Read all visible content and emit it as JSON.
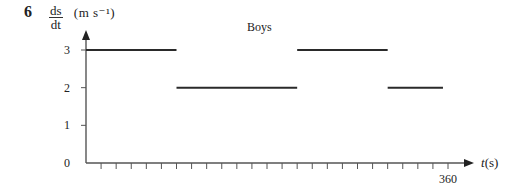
{
  "question_number": "6",
  "y_axis": {
    "label_numerator": "ds",
    "label_denominator": "dt",
    "unit": "(m s⁻¹)"
  },
  "x_axis": {
    "label_var": "t",
    "label_unit": "(s)",
    "end_label": "360"
  },
  "title": "Boys",
  "chart_data": {
    "type": "line",
    "title": "Boys",
    "xlabel": "t (s)",
    "ylabel": "ds/dt (m s⁻¹)",
    "xlim": [
      0,
      360
    ],
    "ylim": [
      0,
      3
    ],
    "x_ticks": {
      "count": 24,
      "step": 15,
      "labeled": [
        {
          "value": 360,
          "label": "360"
        }
      ]
    },
    "y_ticks": [
      0,
      1,
      2,
      3
    ],
    "grid": false,
    "series": [
      {
        "name": "Boys",
        "segments": [
          {
            "x": [
              0,
              90
            ],
            "y": [
              3,
              3
            ]
          },
          {
            "x": [
              90,
              210
            ],
            "y": [
              2,
              2
            ]
          },
          {
            "x": [
              210,
              300
            ],
            "y": [
              3,
              3
            ]
          },
          {
            "x": [
              300,
              355
            ],
            "y": [
              2,
              2
            ]
          }
        ]
      }
    ]
  },
  "colors": {
    "axis": "#555555",
    "line": "#2a2a2a",
    "text": "#222222"
  }
}
